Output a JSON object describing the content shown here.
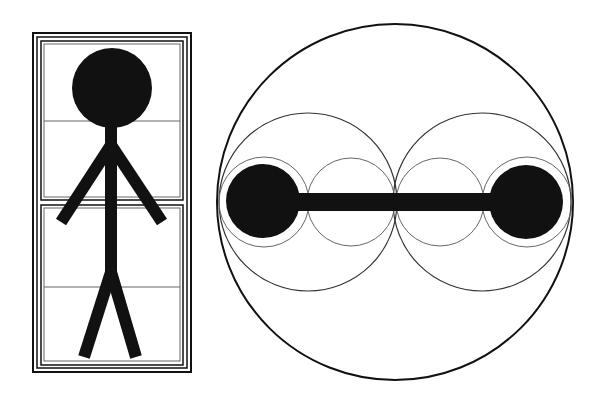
{
  "diagram": {
    "title": "",
    "colors": {
      "background": "#ffffff",
      "ink": "#111111",
      "thin_line": "#555555"
    },
    "figures": [
      {
        "id": "stick-figure-panel",
        "description": "Stick figure inside a tall rectangle made of triple-line frames, split into two stacked panels each with one horizontal divider line",
        "parts": [
          "frame-outer-lines",
          "upper-panel",
          "lower-panel",
          "head",
          "body",
          "left-arm",
          "right-arm",
          "left-leg",
          "right-leg"
        ]
      },
      {
        "id": "dumbbell-circles",
        "description": "Large outer circle containing two medium tangent circles, two small circles between them, two small circles at the ends, and a dumbbell (two filled disks joined by a bar)",
        "parts": [
          "outer-circle",
          "medium-circle-left",
          "medium-circle-right",
          "small-circle-left-end",
          "small-circle-left-inner",
          "small-circle-right-inner",
          "small-circle-right-end",
          "disk-left",
          "disk-right",
          "bar"
        ]
      }
    ]
  }
}
